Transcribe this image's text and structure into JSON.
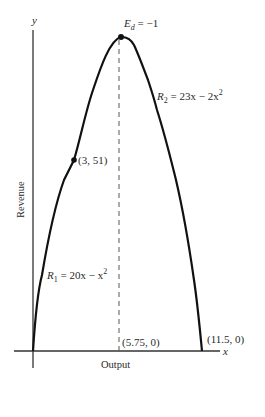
{
  "figure": {
    "type": "diagram",
    "axes": {
      "x_label": "x",
      "y_label": "y",
      "x_title": "Output",
      "y_title": "Revenue"
    },
    "curves": [
      {
        "name": "R1",
        "label_main": "R",
        "label_sub": "1",
        "label_eq": " = 20x − x",
        "label_sup": "2",
        "equation": "R1 = 20x − x^2",
        "domain": [
          0,
          3
        ]
      },
      {
        "name": "R2",
        "label_main": "R",
        "label_sub": "2",
        "label_eq": " = 23x − 2x",
        "label_sup": "2",
        "equation": "R2 = 23x − 2x^2",
        "domain": [
          3,
          11.5
        ]
      }
    ],
    "annotations": {
      "peak": {
        "label_main": "E",
        "label_sub": "d",
        "label_rest": " = −1",
        "x": 5.75
      },
      "kink_point": "(3, 51)",
      "midpoint_x": "(5.75, 0)",
      "end_point": "(11.5, 0)"
    },
    "colors": {
      "line": "#111111",
      "text": "#2a2a2a",
      "axis": "#333333",
      "dashed": "#555555"
    }
  }
}
